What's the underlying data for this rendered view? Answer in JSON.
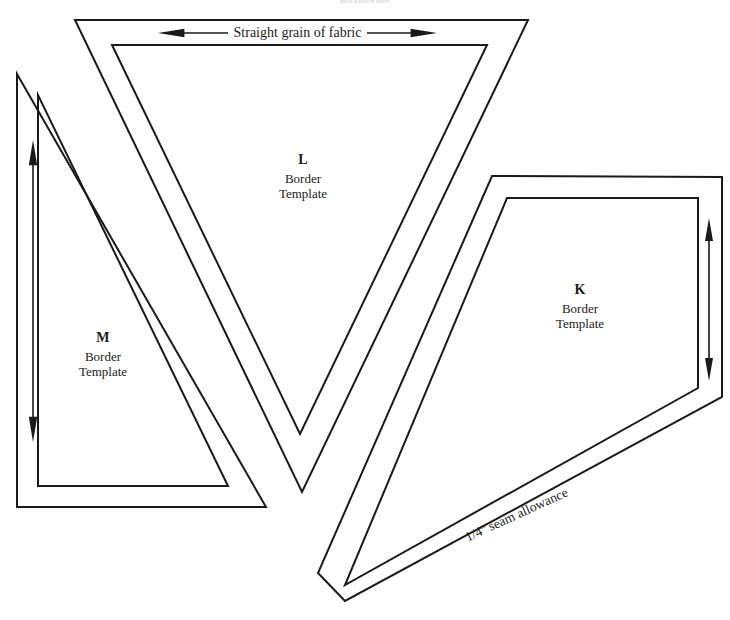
{
  "page": {
    "width": 730,
    "height": 620,
    "background": "#ffffff",
    "ink": "#1a1a1a",
    "header_note": "quilt pattern sheet"
  },
  "captions": {
    "grain": "Straight grain of fabric",
    "seam": "1/4'' seam allowance"
  },
  "templates": [
    {
      "id": "L",
      "letter": "L",
      "line1": "Border",
      "line2": "Template",
      "label_x": 303,
      "label_y": 152,
      "cut_path": "M 75 20 L 528 20 L 302 492 Z",
      "sew_path": "M 112 45 L 487 45 L 300 434 Z"
    },
    {
      "id": "M",
      "letter": "M",
      "line1": "Border",
      "line2": "Template",
      "label_x": 103,
      "label_y": 330,
      "cut_path": "M 17 74 L 17 507 L 266 507 Z",
      "sew_path": "M 38 95 L 38 486 L 228 486 Z"
    },
    {
      "id": "K",
      "letter": "K",
      "line1": "Border",
      "line2": "Template",
      "label_x": 580,
      "label_y": 282,
      "cut_path": "M 492 176 L 722 177 L 722 397 L 318 574 L 345 600 L 318 574 Z",
      "sew_path": "M 507 198 L 698 198 L 698 388 L 345 585 Z"
    }
  ],
  "template_shapes": {
    "K_cut_outline": "M 492 176 L 722 177 L 722 397 L 345 601 L 318 573 Z"
  },
  "arrows": {
    "grain_horizontal": {
      "name": "grain-arrow-horizontal",
      "x1": 158,
      "x2": 437,
      "y": 33,
      "head": 11
    },
    "grain_vertical_m": {
      "name": "grain-arrow-m",
      "x": 33,
      "y1": 140,
      "y2": 442,
      "head": 11
    },
    "grain_vertical_k": {
      "name": "grain-arrow-k",
      "x": 709,
      "y1": 218,
      "y2": 381,
      "head": 10
    }
  },
  "seam_label": {
    "x": 466,
    "y": 530,
    "rotation_deg": -24.5
  }
}
